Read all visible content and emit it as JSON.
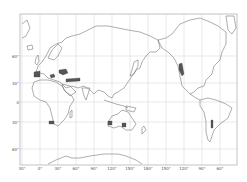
{
  "map": {
    "projection": "world map, Pacific-centered",
    "latitude_labels": [
      {
        "label": "60°",
        "y": 56
      },
      {
        "label": "30°",
        "y": 83
      },
      {
        "label": "0",
        "y": 102
      },
      {
        "label": "30°",
        "y": 122
      },
      {
        "label": "60°",
        "y": 149
      }
    ],
    "longitude_labels": [
      {
        "label": "30°",
        "x": 22
      },
      {
        "label": "0°",
        "x": 40
      },
      {
        "label": "30°",
        "x": 58
      },
      {
        "label": "60°",
        "x": 76
      },
      {
        "label": "90°",
        "x": 94
      },
      {
        "label": "120°",
        "x": 112
      },
      {
        "label": "150°",
        "x": 130
      },
      {
        "label": "180°",
        "x": 148
      },
      {
        "label": "150°",
        "x": 166
      },
      {
        "label": "120°",
        "x": 184
      },
      {
        "label": "90°",
        "x": 202
      },
      {
        "label": "60°",
        "x": 220
      }
    ],
    "highlighted_regions": [
      "Iberian Peninsula",
      "Mediterranean / Turkey / Middle East",
      "South Africa (Cape)",
      "Southwest Australia",
      "South Australia",
      "California (west coast of North America)",
      "Central Chile"
    ],
    "colors": {
      "land_outline": "#666666",
      "highlight": "#555555",
      "grid": "#bbbbbb",
      "background": "#ffffff"
    }
  }
}
